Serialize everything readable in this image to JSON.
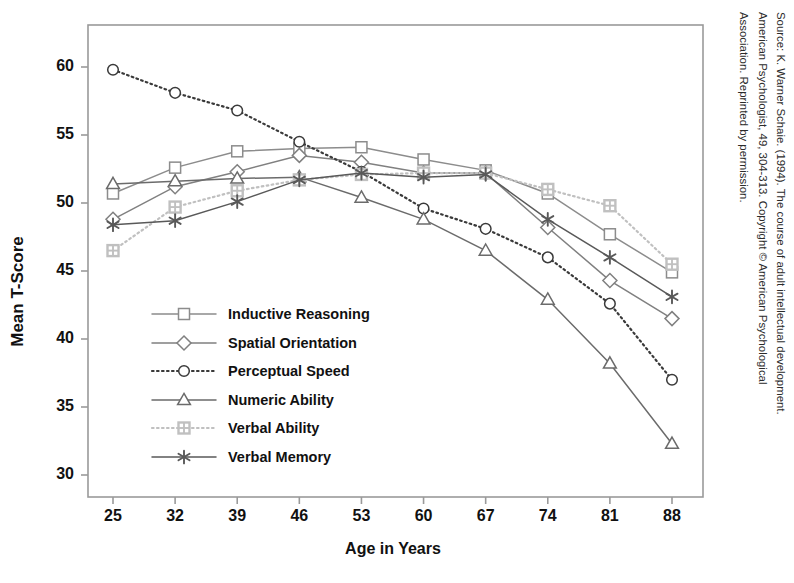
{
  "chart_data": {
    "type": "line",
    "title": "",
    "xlabel": "Age in Years",
    "ylabel": "Mean T-Score",
    "categories": [
      25,
      32,
      39,
      46,
      53,
      60,
      67,
      74,
      81,
      88
    ],
    "xtick_labels": [
      "25",
      "32",
      "39",
      "46",
      "53",
      "60",
      "67",
      "74",
      "81",
      "88"
    ],
    "ytick_labels": [
      "30",
      "35",
      "40",
      "45",
      "50",
      "55",
      "60"
    ],
    "ylim": [
      28.4,
      61.6
    ],
    "xlim": [
      21.5,
      91.5
    ],
    "grid": false,
    "legend_position": "inside-lower-left",
    "series": [
      {
        "name": "Inductive Reasoning",
        "marker": "square",
        "line_style": "solid",
        "color": "#8c8c8c",
        "values": [
          50.7,
          52.6,
          53.8,
          54.0,
          54.1,
          53.2,
          52.4,
          50.7,
          47.7,
          44.9
        ]
      },
      {
        "name": "Spatial Orientation",
        "marker": "diamond",
        "line_style": "solid",
        "color": "#808080",
        "values": [
          48.8,
          51.2,
          52.3,
          53.5,
          53.0,
          52.2,
          52.2,
          48.2,
          44.3,
          41.5
        ]
      },
      {
        "name": "Perceptual Speed",
        "marker": "circle",
        "line_style": "dotted",
        "color": "#3a3a3a",
        "values": [
          59.8,
          58.1,
          56.8,
          54.5,
          52.3,
          49.6,
          48.1,
          46.0,
          42.6,
          37.0
        ]
      },
      {
        "name": "Numeric Ability",
        "marker": "triangle",
        "line_style": "solid",
        "color": "#6b6b6b",
        "values": [
          51.4,
          51.6,
          51.8,
          51.9,
          50.4,
          48.8,
          46.5,
          42.9,
          38.2,
          32.3
        ]
      },
      {
        "name": "Verbal Ability",
        "marker": "crossed-square",
        "line_style": "dotted",
        "color": "#c0c0c0",
        "values": [
          46.5,
          49.7,
          50.9,
          51.7,
          52.1,
          52.2,
          52.2,
          51.0,
          49.8,
          45.5
        ]
      },
      {
        "name": "Verbal Memory",
        "marker": "asterisk",
        "line_style": "solid",
        "color": "#595959",
        "values": [
          48.4,
          48.7,
          50.1,
          51.7,
          52.2,
          51.9,
          52.1,
          48.8,
          46.0,
          43.1
        ]
      }
    ]
  },
  "legend": {
    "items": [
      {
        "label": "Inductive Reasoning",
        "marker": "square",
        "line_style": "solid",
        "color": "#8c8c8c"
      },
      {
        "label": "Spatial Orientation",
        "marker": "diamond",
        "line_style": "solid",
        "color": "#808080"
      },
      {
        "label": "Perceptual Speed",
        "marker": "circle",
        "line_style": "dotted",
        "color": "#3a3a3a"
      },
      {
        "label": "Numeric Ability",
        "marker": "triangle",
        "line_style": "solid",
        "color": "#6b6b6b"
      },
      {
        "label": "Verbal Ability",
        "marker": "crossed-square",
        "line_style": "dotted",
        "color": "#c0c0c0"
      },
      {
        "label": "Verbal Memory",
        "marker": "asterisk",
        "line_style": "solid",
        "color": "#595959"
      }
    ]
  },
  "source_note": {
    "line1": "Source: K. Warner Schaie. (1994). The course of adult intellectual development.",
    "line2": "American Psychologist, 49, 304-313. Copyright © American Psychological",
    "line3": "Association. Reprinted by permission."
  },
  "style": {
    "frame_color": "#9a9a9a",
    "background": "#ffffff",
    "text_color": "#111111"
  }
}
